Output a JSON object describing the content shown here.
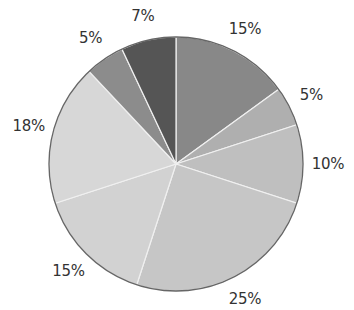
{
  "chart_data": {
    "type": "pie",
    "title": "",
    "start_angle": "12 o'clock, clockwise",
    "slices": [
      {
        "label": "15%",
        "value": 15,
        "color": "#888888"
      },
      {
        "label": "5%",
        "value": 5,
        "color": "#afafaf"
      },
      {
        "label": "10%",
        "value": 10,
        "color": "#bfbfbf"
      },
      {
        "label": "25%",
        "value": 25,
        "color": "#c6c6c6"
      },
      {
        "label": "15%",
        "value": 15,
        "color": "#d2d2d2"
      },
      {
        "label": "18%",
        "value": 18,
        "color": "#d7d7d7"
      },
      {
        "label": "5%",
        "value": 5,
        "color": "#8c8c8c"
      },
      {
        "label": "7%",
        "value": 7,
        "color": "#555555"
      }
    ],
    "values": [
      15,
      5,
      10,
      25,
      15,
      18,
      5,
      7
    ],
    "categories": [
      "15%",
      "5%",
      "10%",
      "25%",
      "15%",
      "18%",
      "5%",
      "7%"
    ],
    "legend": "none",
    "outline_color": "#666666",
    "separator_color": "#f0f0f0"
  }
}
